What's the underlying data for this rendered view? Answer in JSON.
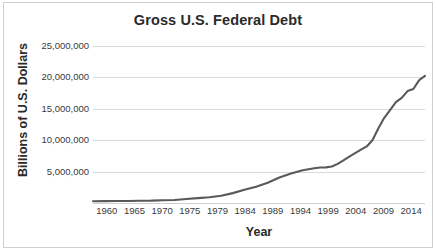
{
  "chart_data": {
    "type": "line",
    "title": "Gross U.S. Federal Debt",
    "xlabel": "Year",
    "ylabel": "Billions of U.S. Dollars",
    "grid": true,
    "legend": "none",
    "line_color": "#595959",
    "grid_color": "#d9d9d9",
    "text_color": "#2b2b2b",
    "xlim": [
      1960,
      2017
    ],
    "ylim": [
      0,
      25000000
    ],
    "ytick_values": [
      5000000,
      10000000,
      15000000,
      20000000,
      25000000
    ],
    "ytick_labels": [
      "5,000,000",
      "10,000,000",
      "15,000,000",
      "20,000,000",
      "25,000,000"
    ],
    "xtick_labels": [
      "1960",
      "1965",
      "1970",
      "1975",
      "1979",
      "1984",
      "1989",
      "1994",
      "1999",
      "2004",
      "2009",
      "2014"
    ],
    "xtick_values": [
      1960,
      1965,
      1970,
      1975,
      1979,
      1984,
      1989,
      1994,
      1999,
      2004,
      2009,
      2014
    ],
    "x": [
      1960,
      1962,
      1964,
      1966,
      1968,
      1970,
      1972,
      1974,
      1976,
      1978,
      1980,
      1982,
      1984,
      1986,
      1988,
      1990,
      1992,
      1994,
      1996,
      1998,
      1999,
      2000,
      2001,
      2002,
      2003,
      2004,
      2005,
      2006,
      2007,
      2008,
      2009,
      2010,
      2011,
      2012,
      2013,
      2014,
      2015,
      2016,
      2017
    ],
    "values": [
      286300,
      298200,
      311700,
      329300,
      368700,
      380900,
      435900,
      483900,
      629000,
      776600,
      909000,
      1142000,
      1572000,
      2125000,
      2602000,
      3233000,
      4064000,
      4693000,
      5225000,
      5526000,
      5656000,
      5674000,
      5807000,
      6228000,
      6783000,
      7379000,
      7933000,
      8507000,
      9008000,
      10025000,
      11910000,
      13562000,
      14790000,
      16066000,
      16738000,
      17824000,
      18151000,
      19573000,
      20245000
    ]
  }
}
